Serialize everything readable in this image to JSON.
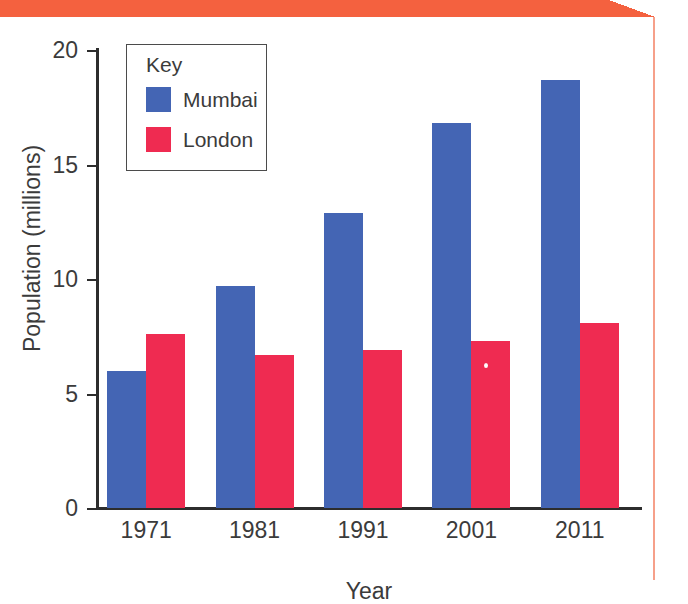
{
  "decoration": {
    "banner_color": "#f4613f",
    "banner_notch_name": "corner-notch",
    "rule_color": "#f6a08a"
  },
  "legend": {
    "title": "Key",
    "entries": [
      {
        "label": "Mumbai",
        "color": "#4465b4"
      },
      {
        "label": "London",
        "color": "#ef2b51"
      }
    ]
  },
  "chart_data": {
    "type": "bar",
    "title": "",
    "xlabel": "Year",
    "ylabel": "Population (millions)",
    "categories": [
      "1971",
      "1981",
      "1991",
      "2001",
      "2011"
    ],
    "series": [
      {
        "name": "Mumbai",
        "color": "#4465b4",
        "values": [
          6.0,
          9.7,
          12.9,
          16.8,
          18.7
        ]
      },
      {
        "name": "London",
        "color": "#ef2b51",
        "values": [
          7.6,
          6.7,
          6.9,
          7.3,
          8.1
        ]
      }
    ],
    "ylim": [
      0,
      20
    ],
    "yticks": [
      0,
      5,
      10,
      15,
      20
    ],
    "ytick_labels": [
      "0",
      "5",
      "10",
      "15",
      "20"
    ],
    "grid": false,
    "legend_position": "upper-left-inside"
  }
}
